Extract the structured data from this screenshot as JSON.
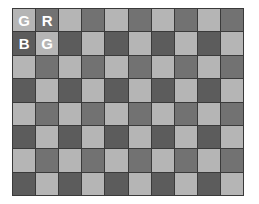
{
  "diagram": {
    "rows": 8,
    "cols": 10,
    "colors": {
      "green": "#b5b5b5",
      "red": "#727272",
      "blue": "#5c5c5c",
      "border": "#3a3a3a"
    },
    "pattern": [
      [
        "G",
        "R"
      ],
      [
        "B",
        "G"
      ]
    ],
    "labels": [
      {
        "row": 0,
        "col": 0,
        "text": "G"
      },
      {
        "row": 0,
        "col": 1,
        "text": "R"
      },
      {
        "row": 1,
        "col": 0,
        "text": "B"
      },
      {
        "row": 1,
        "col": 1,
        "text": "G"
      }
    ]
  }
}
